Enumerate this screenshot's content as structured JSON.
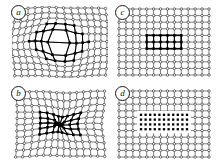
{
  "figure": {
    "type": "finite-element-mesh-panels",
    "background": "#ffffff",
    "line_color": "#1a1a1a",
    "node_open_fill": "#ffffff",
    "node_filled_fill": "#000000",
    "panel_count": 4
  },
  "panels": [
    {
      "id": "a",
      "label": "a",
      "position": "top-left",
      "mesh": {
        "cols": 14,
        "rows": 11,
        "deformed": true,
        "deformation": "expansion",
        "inclusion_shape": "ellipse",
        "inclusion_cols": 8,
        "inclusion_rows": 5,
        "inclusion_node_style": "filled",
        "matrix_node_style": "open"
      }
    },
    {
      "id": "b",
      "label": "b",
      "position": "bottom-left",
      "mesh": {
        "cols": 14,
        "rows": 11,
        "deformed": true,
        "deformation": "contraction",
        "inclusion_shape": "rectangle",
        "inclusion_cols": 8,
        "inclusion_rows": 5,
        "inclusion_node_style": "filled",
        "matrix_node_style": "open"
      }
    },
    {
      "id": "c",
      "label": "c",
      "position": "top-right",
      "mesh": {
        "cols": 14,
        "rows": 11,
        "deformed": false,
        "deformation": "none",
        "inclusion_shape": "rectangle",
        "inclusion_cols": 6,
        "inclusion_rows": 3,
        "inclusion_node_style": "filled",
        "matrix_node_style": "open"
      }
    },
    {
      "id": "d",
      "label": "d",
      "position": "bottom-right",
      "mesh": {
        "cols": 14,
        "rows": 11,
        "deformed": false,
        "deformation": "none",
        "inclusion_shape": "dense-cluster",
        "inclusion_cols": 11,
        "inclusion_rows": 4,
        "inclusion_node_style": "filled",
        "matrix_node_style": "open"
      }
    }
  ]
}
